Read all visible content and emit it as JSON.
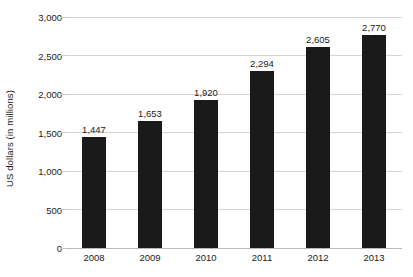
{
  "chart_data": {
    "type": "bar",
    "title": "",
    "subtitle": "",
    "xlabel": "",
    "ylabel": "US dollars (in millions)",
    "categories": [
      "2008",
      "2009",
      "2010",
      "2011",
      "2012",
      "2013"
    ],
    "values": [
      1447,
      1653,
      1920,
      2294,
      2605,
      2770
    ],
    "data_labels": [
      "1,447",
      "1,653",
      "1,920",
      "2,294",
      "2,605",
      "2,770"
    ],
    "ylim": [
      0,
      3000
    ],
    "y_ticks": [
      0,
      500,
      1000,
      1500,
      2000,
      2500,
      3000
    ],
    "y_tick_labels": [
      "0",
      "500",
      "1,000",
      "1,500",
      "2,000",
      "2,500",
      "3,000"
    ],
    "grid": true,
    "grid_axis": "y",
    "legend": false,
    "legend_position": "none",
    "series": [
      {
        "name": "US dollars (in millions)",
        "values": [
          1447,
          1653,
          1920,
          2294,
          2605,
          2770
        ]
      }
    ],
    "colors": {
      "bar": "#1a1a1a",
      "gridline": "#d4d4d4",
      "baseline": "#b8b8b8",
      "text": "#1a1a1a",
      "background": "#ffffff"
    }
  }
}
